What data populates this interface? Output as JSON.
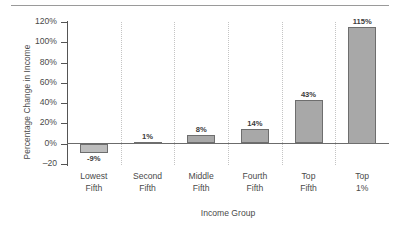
{
  "chart_data": {
    "type": "bar",
    "title": "",
    "subtitle": "",
    "xlabel": "Income Group",
    "ylabel": "Percentage Change in Income",
    "categories": [
      "Lowest Fifth",
      "Second Fifth",
      "Middle Fifth",
      "Fourth Fifth",
      "Top Fifth",
      "Top 1%"
    ],
    "category_lines": [
      [
        "Lowest",
        "Fifth"
      ],
      [
        "Second",
        "Fifth"
      ],
      [
        "Middle",
        "Fifth"
      ],
      [
        "Fourth",
        "Fifth"
      ],
      [
        "Top",
        "Fifth"
      ],
      [
        "Top",
        "1%"
      ]
    ],
    "values": [
      -9,
      1,
      8,
      14,
      43,
      115
    ],
    "data_labels": [
      "-9%",
      "1%",
      "8%",
      "14%",
      "43%",
      "115%"
    ],
    "ylim": [
      -20,
      130
    ],
    "ytick_values": [
      120,
      100,
      80,
      60,
      40,
      20,
      0,
      -20
    ],
    "ytick_labels": [
      "120%",
      "100%",
      "80%",
      "60%",
      "40%",
      "20%",
      "0%",
      "–20"
    ],
    "grid": "vertical-dotted-category-separators",
    "legend": "none",
    "bar_color": "#a8a8a8",
    "bar_edge_color": "#6e6e6e",
    "axis_color": "#6b6b6b",
    "text_color": "#4a4a4a"
  }
}
